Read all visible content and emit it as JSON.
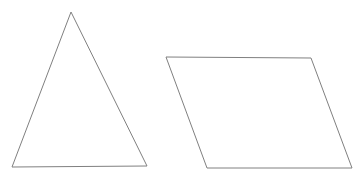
{
  "canvas": {
    "width": 364,
    "height": 178,
    "background_color": "#ffffff"
  },
  "style": {
    "stroke_color": "#808080",
    "stroke_width": 1,
    "fill": "none"
  },
  "shapes": [
    {
      "name": "triangle",
      "kind": "polygon",
      "sides": 3,
      "label": "triangle",
      "points": "71,12 147,166 12,167",
      "vertices": [
        {
          "x": 71,
          "y": 12
        },
        {
          "x": 147,
          "y": 166
        },
        {
          "x": 12,
          "y": 167
        }
      ]
    },
    {
      "name": "parallelogram",
      "kind": "polygon",
      "sides": 4,
      "label": "parallelogram",
      "points": "166,57 311,58 352,168 207,168",
      "vertices": [
        {
          "x": 166,
          "y": 57
        },
        {
          "x": 311,
          "y": 58
        },
        {
          "x": 352,
          "y": 168
        },
        {
          "x": 207,
          "y": 168
        }
      ]
    }
  ]
}
